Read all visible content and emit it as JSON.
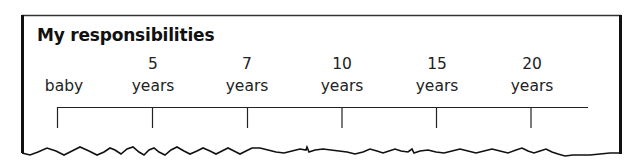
{
  "title": "My responsibilities",
  "timeline": {
    "points": [
      {
        "number": "",
        "word": "baby",
        "x": 58
      },
      {
        "number": "5",
        "word": "years",
        "x": 153
      },
      {
        "number": "7",
        "word": "years",
        "x": 247
      },
      {
        "number": "10",
        "word": "years",
        "x": 342
      },
      {
        "number": "15",
        "word": "years",
        "x": 437
      },
      {
        "number": "20",
        "word": "years",
        "x": 531
      }
    ]
  },
  "colors": {
    "line": "#222222",
    "border": "#111111",
    "background": "#ffffff"
  }
}
